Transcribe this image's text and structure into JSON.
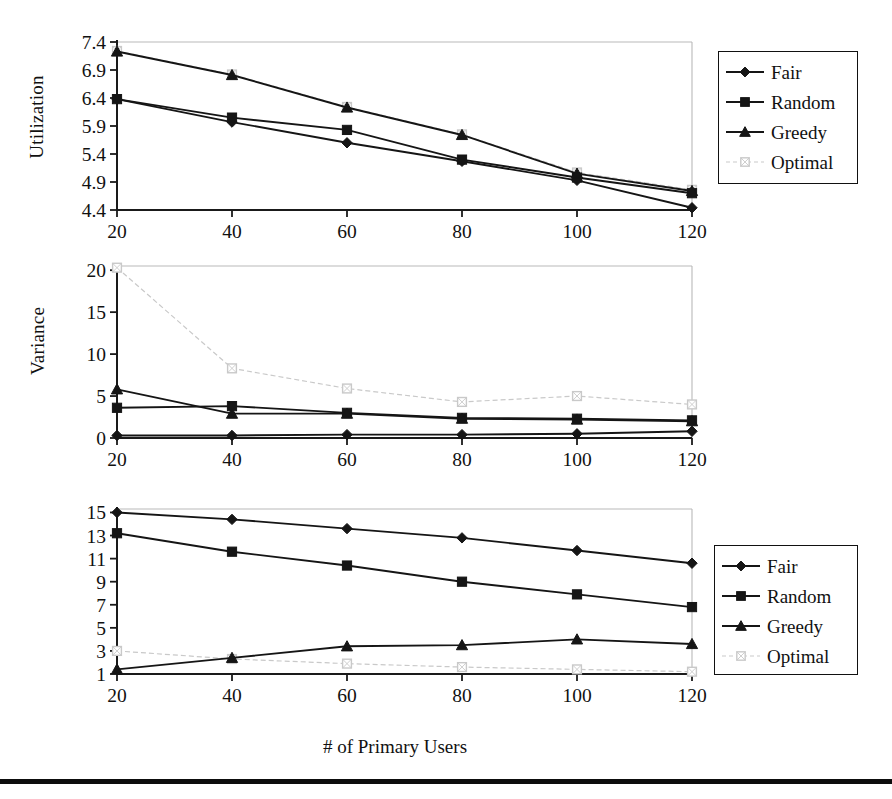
{
  "figure": {
    "xlabel": "# of Primary Users",
    "xticks": [
      20,
      40,
      60,
      80,
      100,
      120
    ],
    "bottom_rule": true
  },
  "colors": {
    "dark_series": "#151515",
    "light_series": "#c9c9c9",
    "axis": "#1a1a1a",
    "frame": "#b9b9b9",
    "text": "#111111"
  },
  "chart_data": [
    {
      "id": "utilization",
      "type": "line",
      "title": "",
      "xlabel": "",
      "ylabel": "Utilization",
      "x": [
        20,
        40,
        60,
        80,
        100,
        120
      ],
      "xlim": [
        20,
        120
      ],
      "ylim": [
        4.4,
        7.4
      ],
      "yticks": [
        4.4,
        4.9,
        5.4,
        5.9,
        6.4,
        6.9,
        7.4
      ],
      "ytick_labels": [
        "4.4",
        "4.9",
        "5.4",
        "5.9",
        "6.4",
        "6.9",
        "7.4"
      ],
      "grid": false,
      "legend_position": "right",
      "series": [
        {
          "name": "Fair",
          "marker": "diamond",
          "style": "solid-dark",
          "values": [
            6.38,
            5.97,
            5.6,
            5.27,
            4.93,
            4.44
          ]
        },
        {
          "name": "Random",
          "marker": "square",
          "style": "solid-dark",
          "values": [
            6.38,
            6.05,
            5.83,
            5.3,
            4.98,
            4.7
          ]
        },
        {
          "name": "Greedy",
          "marker": "triangle",
          "style": "solid-dark",
          "values": [
            7.23,
            6.81,
            6.23,
            5.74,
            5.05,
            4.74
          ]
        },
        {
          "name": "Optimal",
          "marker": "opensquare",
          "style": "dashed-light",
          "values": [
            7.24,
            6.82,
            6.24,
            5.75,
            5.07,
            4.76
          ]
        }
      ]
    },
    {
      "id": "variance",
      "type": "line",
      "title": "",
      "xlabel": "",
      "ylabel": "Variance",
      "x": [
        20,
        40,
        60,
        80,
        100,
        120
      ],
      "xlim": [
        20,
        120
      ],
      "ylim": [
        0,
        20.5
      ],
      "yticks": [
        0,
        5,
        10,
        15,
        20
      ],
      "ytick_labels": [
        "0",
        "5",
        "10",
        "15",
        "20"
      ],
      "grid": false,
      "legend_position": "right",
      "series": [
        {
          "name": "Fair",
          "marker": "diamond",
          "style": "solid-dark",
          "values": [
            0.3,
            0.3,
            0.4,
            0.4,
            0.5,
            0.8
          ]
        },
        {
          "name": "Random",
          "marker": "square",
          "style": "solid-dark",
          "values": [
            3.6,
            3.8,
            3.0,
            2.4,
            2.3,
            2.1
          ]
        },
        {
          "name": "Greedy",
          "marker": "triangle",
          "style": "solid-dark",
          "values": [
            5.8,
            2.9,
            2.9,
            2.3,
            2.2,
            2.0
          ]
        },
        {
          "name": "Optimal",
          "marker": "opensquare",
          "style": "dashed-light",
          "values": [
            20.3,
            8.3,
            5.9,
            4.3,
            5.0,
            4.0
          ]
        }
      ]
    },
    {
      "id": "color",
      "type": "line",
      "title": "",
      "xlabel": "# of Primary Users",
      "ylabel": "",
      "x": [
        20,
        40,
        60,
        80,
        100,
        120
      ],
      "xlim": [
        20,
        120
      ],
      "ylim": [
        1,
        15.3
      ],
      "yticks": [
        1,
        3,
        5,
        7,
        9,
        11,
        13,
        15
      ],
      "ytick_labels": [
        "1",
        "3",
        "5",
        "7",
        "9",
        "11",
        "13",
        "15"
      ],
      "grid": false,
      "legend_position": "right",
      "series": [
        {
          "name": "non-opp",
          "marker": "diamond",
          "style": "solid-dark",
          "values": [
            15.0,
            14.4,
            13.6,
            12.8,
            11.7,
            10.6
          ]
        },
        {
          "name": "avgcolor",
          "marker": "square",
          "style": "solid-dark",
          "values": [
            13.2,
            11.6,
            10.4,
            9.0,
            7.9,
            6.8
          ]
        },
        {
          "name": "colorinf",
          "marker": "triangle",
          "style": "solid-dark",
          "values": [
            1.4,
            2.4,
            3.4,
            3.5,
            4.0,
            3.6
          ]
        },
        {
          "name": "varcolor",
          "marker": "opensquare",
          "style": "dashed-light",
          "values": [
            3.0,
            2.3,
            1.9,
            1.6,
            1.4,
            1.2
          ]
        }
      ]
    }
  ],
  "legends": {
    "utilization": [
      "Fair",
      "Random",
      "Greedy",
      "Optimal"
    ],
    "variance": [
      "Fair",
      "Random",
      "Greedy",
      "Optimal"
    ],
    "color": [
      "non-opp",
      "avgcolor",
      "colorinf",
      "varcolor"
    ]
  }
}
